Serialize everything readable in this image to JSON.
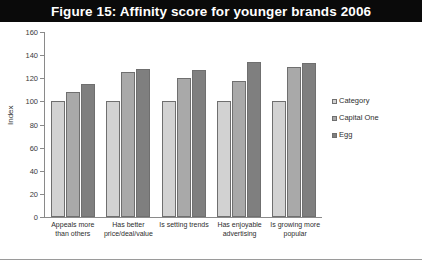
{
  "figure": {
    "title": "Figure 15: Affinity score for younger brands 2006"
  },
  "chart_data": {
    "type": "bar",
    "title": "Figure 15: Affinity score for younger brands 2006",
    "xlabel": "",
    "ylabel": "Index",
    "ylim": [
      0,
      160
    ],
    "yticks": [
      0,
      20,
      40,
      60,
      80,
      100,
      120,
      140,
      160
    ],
    "grid": false,
    "legend_position": "right",
    "categories": [
      "Appeals more than others",
      "Has better price/deal/value",
      "Is setting trends",
      "Has enjoyable advertising",
      "Is growing more popular"
    ],
    "series": [
      {
        "name": "Category",
        "color": "#d2d2d2",
        "values": [
          100,
          100,
          100,
          100,
          100
        ]
      },
      {
        "name": "Capital One",
        "color": "#a9a9a9",
        "values": [
          108,
          125,
          120,
          118,
          130
        ]
      },
      {
        "name": "Egg",
        "color": "#7f7f7f",
        "values": [
          115,
          128,
          127,
          134,
          133
        ]
      }
    ]
  },
  "legend": {
    "items": [
      {
        "label": "Category"
      },
      {
        "label": "Capital One"
      },
      {
        "label": "Egg"
      }
    ]
  },
  "colors": {
    "title_background": "#0a0a0a",
    "title_text": "#ffffff",
    "axis": "#8a8a8a",
    "plot_background": "#ffffff"
  }
}
